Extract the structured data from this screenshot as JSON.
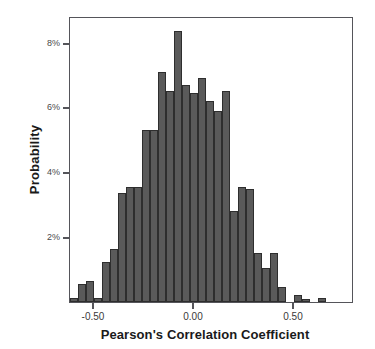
{
  "chart_data": {
    "type": "bar",
    "title": "",
    "xlabel": "Pearson's Correlation Coefficient",
    "ylabel": "Probability",
    "grid": false,
    "legend": "none",
    "xlim": [
      -0.62,
      0.8
    ],
    "ylim": [
      0,
      8.82
    ],
    "xtick_labels": [
      "-0.50",
      "0.00",
      "0.50"
    ],
    "xtick_values": [
      -0.5,
      0.0,
      0.5
    ],
    "ytick_labels": [
      "2%",
      "4%",
      "6%",
      "8%"
    ],
    "ytick_values": [
      2,
      4,
      6,
      8
    ],
    "bin_width": 0.04,
    "value_unit": "percent",
    "categories": [
      "-0.62",
      "-0.58",
      "-0.54",
      "-0.50",
      "-0.46",
      "-0.42",
      "-0.38",
      "-0.34",
      "-0.30",
      "-0.26",
      "-0.22",
      "-0.18",
      "-0.14",
      "-0.10",
      "-0.06",
      "-0.02",
      "0.02",
      "0.06",
      "0.10",
      "0.14",
      "0.18",
      "0.22",
      "0.26",
      "0.30",
      "0.34",
      "0.38",
      "0.42",
      "0.46",
      "0.50",
      "0.54",
      "0.62",
      "0.66",
      "0.76"
    ],
    "values": [
      0.12,
      0.55,
      0.65,
      0.12,
      1.22,
      1.65,
      3.35,
      3.55,
      3.55,
      5.3,
      5.3,
      7.1,
      6.5,
      8.35,
      6.7,
      6.45,
      6.9,
      6.2,
      5.9,
      6.5,
      2.8,
      3.55,
      3.5,
      1.5,
      1.05,
      1.5,
      0.45,
      0.0,
      0.22,
      0.1,
      0.12,
      0.0,
      0.0
    ],
    "bars": [
      {
        "x": -0.62,
        "value": 0.12
      },
      {
        "x": -0.58,
        "value": 0.55
      },
      {
        "x": -0.54,
        "value": 0.65
      },
      {
        "x": -0.5,
        "value": 0.12
      },
      {
        "x": -0.46,
        "value": 1.22
      },
      {
        "x": -0.42,
        "value": 1.65
      },
      {
        "x": -0.38,
        "value": 3.35
      },
      {
        "x": -0.34,
        "value": 3.55
      },
      {
        "x": -0.3,
        "value": 3.55
      },
      {
        "x": -0.26,
        "value": 5.3
      },
      {
        "x": -0.22,
        "value": 5.3
      },
      {
        "x": -0.18,
        "value": 7.1
      },
      {
        "x": -0.14,
        "value": 6.5
      },
      {
        "x": -0.1,
        "value": 8.35
      },
      {
        "x": -0.06,
        "value": 6.7
      },
      {
        "x": -0.02,
        "value": 6.45
      },
      {
        "x": 0.02,
        "value": 6.9
      },
      {
        "x": 0.06,
        "value": 6.2
      },
      {
        "x": 0.1,
        "value": 5.9
      },
      {
        "x": 0.14,
        "value": 6.5
      },
      {
        "x": 0.18,
        "value": 2.8
      },
      {
        "x": 0.22,
        "value": 3.55
      },
      {
        "x": 0.26,
        "value": 3.5
      },
      {
        "x": 0.3,
        "value": 1.5
      },
      {
        "x": 0.34,
        "value": 1.05
      },
      {
        "x": 0.38,
        "value": 1.5
      },
      {
        "x": 0.42,
        "value": 0.45
      },
      {
        "x": 0.5,
        "value": 0.22
      },
      {
        "x": 0.54,
        "value": 0.1
      },
      {
        "x": 0.62,
        "value": 0.12
      }
    ]
  }
}
